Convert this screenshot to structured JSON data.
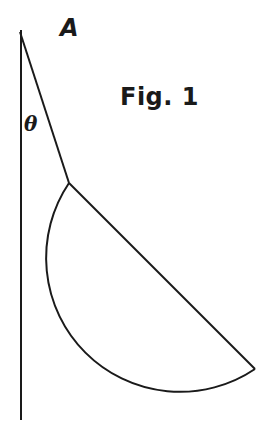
{
  "labels": {
    "point": "A",
    "angle": "θ",
    "figure": "Fig. 1"
  },
  "geometry": {
    "wall": {
      "x": 21,
      "y_top": 30,
      "y_bottom": 420
    },
    "string": {
      "from": [
        20,
        32
      ],
      "to": [
        69,
        183
      ]
    },
    "semicircle": {
      "diameter_start": [
        69,
        183
      ],
      "diameter_end": [
        255,
        369
      ],
      "radius": 136
    }
  },
  "colors": {
    "stroke": "#1a1a1a",
    "background": "#ffffff"
  }
}
